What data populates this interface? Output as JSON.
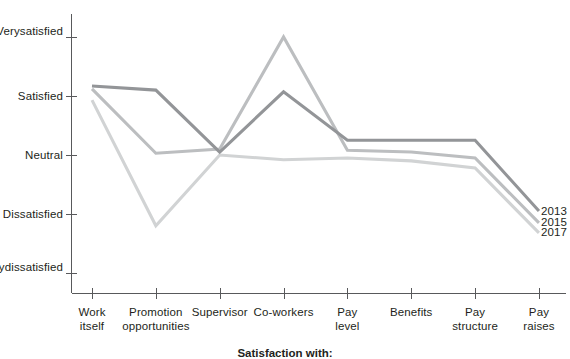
{
  "chart_data": {
    "type": "line",
    "title": "",
    "xlabel": "Satisfaction with:",
    "ylabel": "",
    "grid": false,
    "legend_position": "right-inline-end-of-line",
    "categories": [
      "Work itself",
      "Promotion opportunities",
      "Supervisor",
      "Co-workers",
      "Pay level",
      "Benefits",
      "Pay structure",
      "Pay raises"
    ],
    "category_lines": [
      [
        "Work",
        "itself"
      ],
      [
        "Promotion",
        "opportunities"
      ],
      [
        "Supervisor",
        ""
      ],
      [
        "Co-workers",
        ""
      ],
      [
        "Pay",
        "level"
      ],
      [
        "Benefits",
        ""
      ],
      [
        "Pay",
        "structure"
      ],
      [
        "Pay",
        "raises"
      ]
    ],
    "ytick_labels": [
      [
        "Very",
        "satisfied"
      ],
      [
        "Satisfied",
        ""
      ],
      [
        "Neutral",
        ""
      ],
      [
        "Dissatisfied",
        ""
      ],
      [
        "Very",
        "dissatisfied"
      ]
    ],
    "ytick_values": [
      5,
      4,
      3,
      2,
      1
    ],
    "ylim": [
      0.6,
      5.45
    ],
    "series": [
      {
        "name": "2013",
        "color": "#939598",
        "values": [
          4.17,
          4.1,
          3.05,
          4.07,
          3.25,
          3.25,
          3.25,
          2.05
        ]
      },
      {
        "name": "2015",
        "color": "#bcbec0",
        "values": [
          4.12,
          3.03,
          3.1,
          5.0,
          3.08,
          3.05,
          2.95,
          1.85
        ]
      },
      {
        "name": "2017",
        "color": "#d1d3d4",
        "values": [
          3.93,
          1.8,
          3.0,
          2.92,
          2.95,
          2.9,
          2.78,
          1.68
        ]
      }
    ]
  },
  "legend": {
    "entries": [
      {
        "label": "2013"
      },
      {
        "label": "2015"
      },
      {
        "label": "2017"
      }
    ]
  },
  "axis": {
    "x_title": "Satisfaction with:"
  },
  "colors": {
    "axis": "#58595b",
    "text": "#231f20",
    "background": "#ffffff",
    "series_2013": "#939598",
    "series_2015": "#bcbec0",
    "series_2017": "#d1d3d4"
  }
}
